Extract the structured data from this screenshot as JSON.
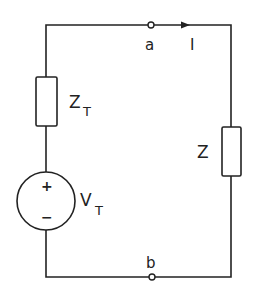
{
  "diagram": {
    "type": "circuit-schematic",
    "colors": {
      "line": "#222222",
      "background": "#ffffff"
    },
    "components": [
      {
        "id": "ZT",
        "kind": "impedance",
        "label": "Z",
        "subscript": "T"
      },
      {
        "id": "VT",
        "kind": "voltage-source",
        "label": "V",
        "subscript": "T",
        "plus": "+",
        "minus": "−"
      },
      {
        "id": "Z",
        "kind": "impedance",
        "label": "Z"
      }
    ],
    "terminals": [
      {
        "id": "a",
        "label": "a"
      },
      {
        "id": "b",
        "label": "b"
      }
    ],
    "current": {
      "label": "I",
      "direction": "right"
    }
  }
}
